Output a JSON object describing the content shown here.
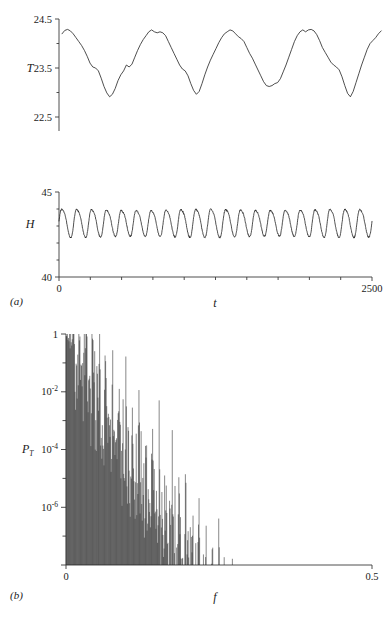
{
  "figure": {
    "type": "scientific-figure",
    "panels": [
      "a",
      "b"
    ],
    "panel_a_label": "(a)",
    "panel_b_label": "(b)"
  },
  "chart_data": [
    {
      "type": "line",
      "panel": "a",
      "subplot": "T",
      "title": "",
      "xlabel": "t",
      "ylabel": "T",
      "xlim": [
        0,
        2500
      ],
      "ylim": [
        22.2,
        24.5
      ],
      "xticklabels": [
        "0",
        "2500"
      ],
      "yticklabels": [
        "24.5",
        "23.5",
        "22.5"
      ],
      "ytickvalues": [
        24.5,
        23.5,
        22.5
      ],
      "x_major_ticks": [
        0,
        250,
        500,
        750,
        1000,
        1250,
        1500,
        1750,
        2000,
        2250,
        2500
      ],
      "grid": false,
      "legend": "none",
      "description": "Irregular slow oscillation of temperature T with about 4.5 cycles, peaks near 23.95 showing double-hump structure, troughs near 22.55",
      "values": [
        23.86,
        23.93,
        23.95,
        23.92,
        23.86,
        23.78,
        23.7,
        23.62,
        23.52,
        23.4,
        23.26,
        23.18,
        23.16,
        23.1,
        22.95,
        22.78,
        22.65,
        22.57,
        22.62,
        22.74,
        22.9,
        23.02,
        23.1,
        23.22,
        23.18,
        23.24,
        23.38,
        23.52,
        23.64,
        23.74,
        23.82,
        23.9,
        23.94,
        23.9,
        23.88,
        23.9,
        23.88,
        23.82,
        23.7,
        23.58,
        23.46,
        23.34,
        23.22,
        23.14,
        23.1,
        23.0,
        22.84,
        22.7,
        22.62,
        22.68,
        22.84,
        23.02,
        23.18,
        23.32,
        23.44,
        23.56,
        23.68,
        23.78,
        23.86,
        23.9,
        23.94,
        23.92,
        23.86,
        23.8,
        23.76,
        23.7,
        23.58,
        23.46,
        23.36,
        23.24,
        23.12,
        23.0,
        22.88,
        22.8,
        22.78,
        22.8,
        22.84,
        22.86,
        22.94,
        23.08,
        23.22,
        23.38,
        23.54,
        23.7,
        23.82,
        23.9,
        23.94,
        23.9,
        23.94,
        23.95,
        23.92,
        23.84,
        23.72,
        23.58,
        23.46,
        23.36,
        23.26,
        23.2,
        23.16,
        23.1,
        22.96,
        22.78,
        22.62,
        22.55,
        22.66,
        22.84,
        23.02,
        23.2,
        23.38,
        23.54,
        23.66,
        23.72,
        23.78,
        23.86,
        23.92
      ]
    },
    {
      "type": "line",
      "panel": "a",
      "subplot": "H",
      "title": "",
      "xlabel": "t",
      "ylabel": "H",
      "xlim": [
        0,
        2500
      ],
      "ylim": [
        40,
        45
      ],
      "xticklabels": [
        "0",
        "2500"
      ],
      "yticklabels": [
        "45",
        "40"
      ],
      "ytickvalues": [
        45,
        40
      ],
      "x_major_ticks": [
        0,
        250,
        500,
        750,
        1000,
        1250,
        1500,
        1750,
        2000,
        2250,
        2500
      ],
      "grid": false,
      "legend": "none",
      "description": "Fast regular oscillation of H, about 21 cycles over the record, peaks near 44.0 and troughs near 42.4, mean near 43.2",
      "cycles": 21,
      "peak": 44.0,
      "trough": 42.4,
      "mean": 43.2
    },
    {
      "type": "line",
      "panel": "b",
      "subplot": "P_T",
      "title": "",
      "xlabel": "f",
      "ylabel": "P_T",
      "xlim": [
        0,
        0.5
      ],
      "ylim": [
        1e-08,
        1
      ],
      "yscale": "log",
      "xticklabels": [
        "0",
        "0.5"
      ],
      "yticklabels": [
        "1",
        "10-2",
        "10-4",
        "10-6"
      ],
      "ytickvalues": [
        1,
        0.01,
        0.0001,
        1e-06
      ],
      "grid": false,
      "legend": "none",
      "description": "Power spectrum of T, a broadband comb of sharp peaks decaying from 1 at f near 0 down to about 1e-8 by f = 0.5"
    }
  ],
  "labels": {
    "T": "T",
    "H": "H",
    "t": "t",
    "f": "f",
    "P": "P",
    "P_sub": "T",
    "y_a_top_1": "24.5",
    "y_a_top_2": "23.5",
    "y_a_top_3": "22.5",
    "y_a_bot_1": "45",
    "y_a_bot_2": "40",
    "x_a_left": "0",
    "x_a_right": "2500",
    "y_b_1": "1",
    "y_b_2_mant": "10",
    "y_b_2_exp": "-2",
    "y_b_3_mant": "10",
    "y_b_3_exp": "-4",
    "y_b_4_mant": "10",
    "y_b_4_exp": "-6",
    "x_b_left": "0",
    "x_b_right": "0.5",
    "panel_a": "(a)",
    "panel_b": "(b)"
  },
  "colors": {
    "trace": "#222222",
    "axis": "#3a3a3a",
    "background": "#ffffff",
    "text": "#1a1a1a"
  }
}
